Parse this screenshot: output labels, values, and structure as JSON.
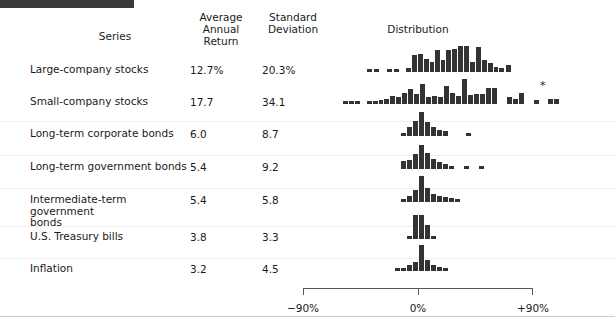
{
  "figure": {
    "distribution_title": "Distribution"
  },
  "table": {
    "headers": {
      "series": "Series",
      "average_annual_return": "Average\nAnnual\nReturn",
      "standard_deviation": "Standard\nDeviation",
      "distribution": "Distribution"
    },
    "rows": [
      {
        "series": "Large-company stocks",
        "average_annual_return": "12.7%",
        "standard_deviation": "20.3%",
        "top": 64,
        "footnote": ""
      },
      {
        "series": "Small-company stocks",
        "average_annual_return": "17.7",
        "standard_deviation": "34.1",
        "top": 96,
        "footnote": "*"
      },
      {
        "series": "Long-term corporate bonds",
        "average_annual_return": "6.0",
        "standard_deviation": "8.7",
        "top": 128,
        "footnote": ""
      },
      {
        "series": "Long-term government bonds",
        "average_annual_return": "5.4",
        "standard_deviation": "9.2",
        "top": 161,
        "footnote": ""
      },
      {
        "series": "Intermediate-term government\nbonds",
        "average_annual_return": "5.4",
        "standard_deviation": "5.8",
        "top": 194,
        "footnote": ""
      },
      {
        "series": "U.S. Treasury bills",
        "average_annual_return": "3.8",
        "standard_deviation": "3.3",
        "top": 231,
        "footnote": ""
      },
      {
        "series": "Inflation",
        "average_annual_return": "3.2",
        "standard_deviation": "4.5",
        "top": 263,
        "footnote": ""
      }
    ]
  },
  "axis": {
    "min_label": "−90%",
    "zero_label": "0%",
    "max_label": "+90%",
    "min_value": -90,
    "zero_value": 0,
    "max_value": 90
  },
  "style": {
    "bar_color": "#333335",
    "rule_color": "#3a3a3c",
    "axis_color": "#58585a",
    "text_color": "#1a1a1a"
  },
  "chart_data": {
    "type": "bar",
    "title": "Distribution",
    "xlabel": "Annual return (%)",
    "ylabel": "Frequency (years)",
    "xlim": [
      -90,
      90
    ],
    "grid": false,
    "legend": "none",
    "note": "Seven stacked histograms of annual returns; bin width 10 percentage points; bar height = number of years in bin.",
    "bin_edges": [
      -90,
      -80,
      -70,
      -60,
      -50,
      -40,
      -30,
      -20,
      -10,
      0,
      10,
      20,
      30,
      40,
      50,
      60,
      70,
      80,
      90
    ],
    "series": [
      {
        "name": "Large-company stocks",
        "average_annual_return": 12.7,
        "standard_deviation": 20.3,
        "bins": [
          -55,
          -45,
          -35,
          -30,
          -25,
          -20,
          -15,
          -10,
          -5,
          0,
          5,
          10,
          15,
          20,
          25,
          30,
          35,
          40,
          45,
          50,
          55,
          60
        ],
        "counts": [
          1,
          1,
          0,
          1,
          1,
          0,
          2,
          3,
          5,
          3,
          6,
          4,
          7,
          8,
          9,
          9,
          4,
          8,
          4,
          3,
          1,
          2
        ]
      },
      {
        "name": "Small-company stocks",
        "average_annual_return": 17.7,
        "standard_deviation": 34.1,
        "footnote": "*",
        "bins": [
          -60,
          -55,
          -50,
          -45,
          -40,
          -35,
          -30,
          -25,
          -20,
          -15,
          -10,
          -5,
          0,
          5,
          10,
          15,
          20,
          25,
          30,
          35,
          40,
          45,
          50,
          55,
          60,
          65,
          70,
          75,
          80,
          85,
          90,
          95,
          100,
          110,
          120,
          130,
          140
        ],
        "counts": [
          1,
          1,
          1,
          0,
          1,
          1,
          1,
          1,
          2,
          2,
          3,
          4,
          5,
          3,
          7,
          4,
          3,
          8,
          5,
          4,
          3,
          2,
          9,
          3,
          3,
          5,
          5,
          1,
          0,
          2,
          3,
          1,
          0,
          1,
          0,
          2,
          2
        ]
      },
      {
        "name": "Long-term corporate bonds",
        "average_annual_return": 6.0,
        "standard_deviation": 8.7,
        "bins": [
          -10,
          -5,
          0,
          5,
          10,
          15,
          20,
          25,
          30,
          45
        ],
        "counts": [
          1,
          4,
          7,
          12,
          7,
          4,
          3,
          2,
          1,
          1
        ]
      },
      {
        "name": "Long-term government bonds",
        "average_annual_return": 5.4,
        "standard_deviation": 9.2,
        "bins": [
          -10,
          -5,
          0,
          5,
          10,
          15,
          20,
          25,
          30,
          40,
          50
        ],
        "counts": [
          3,
          4,
          6,
          11,
          7,
          5,
          3,
          2,
          1,
          1,
          1
        ]
      },
      {
        "name": "Intermediate-term government bonds",
        "average_annual_return": 5.4,
        "standard_deviation": 5.8,
        "bins": [
          -10,
          -5,
          0,
          5,
          10,
          15,
          20,
          25,
          30
        ],
        "counts": [
          1,
          2,
          5,
          13,
          6,
          4,
          3,
          2,
          1
        ]
      },
      {
        "name": "U.S. Treasury bills",
        "average_annual_return": 3.8,
        "standard_deviation": 3.3,
        "bins": [
          -5,
          0,
          5,
          10,
          15
        ],
        "counts": [
          1,
          15,
          9,
          2,
          1
        ]
      },
      {
        "name": "Inflation",
        "average_annual_return": 3.2,
        "standard_deviation": 4.5,
        "bins": [
          -15,
          -10,
          -5,
          0,
          5,
          10,
          15,
          20
        ],
        "counts": [
          1,
          2,
          4,
          16,
          6,
          4,
          2,
          1
        ]
      }
    ]
  },
  "bar_layout": [
    {
      "row": 0,
      "bars": [
        {
          "x": 64,
          "w": 5,
          "h": 3
        },
        {
          "x": 71,
          "w": 5,
          "h": 3
        },
        {
          "x": 84,
          "w": 5,
          "h": 3
        },
        {
          "x": 91,
          "w": 5,
          "h": 3
        },
        {
          "x": 103,
          "w": 5,
          "h": 4
        },
        {
          "x": 109,
          "w": 5,
          "h": 17
        },
        {
          "x": 115,
          "w": 5,
          "h": 18
        },
        {
          "x": 121,
          "w": 5,
          "h": 13
        },
        {
          "x": 127,
          "w": 4,
          "h": 10
        },
        {
          "x": 132,
          "w": 5,
          "h": 22
        },
        {
          "x": 138,
          "w": 4,
          "h": 12
        },
        {
          "x": 143,
          "w": 5,
          "h": 22
        },
        {
          "x": 149,
          "w": 5,
          "h": 23
        },
        {
          "x": 155,
          "w": 5,
          "h": 26
        },
        {
          "x": 161,
          "w": 5,
          "h": 26
        },
        {
          "x": 167,
          "w": 5,
          "h": 10
        },
        {
          "x": 173,
          "w": 5,
          "h": 25
        },
        {
          "x": 179,
          "w": 5,
          "h": 12
        },
        {
          "x": 185,
          "w": 5,
          "h": 9
        },
        {
          "x": 191,
          "w": 4,
          "h": 5
        },
        {
          "x": 196,
          "w": 5,
          "h": 4
        },
        {
          "x": 203,
          "w": 5,
          "h": 7
        }
      ]
    },
    {
      "row": 1,
      "bars": [
        {
          "x": 40,
          "w": 5,
          "h": 3
        },
        {
          "x": 46,
          "w": 5,
          "h": 3
        },
        {
          "x": 52,
          "w": 5,
          "h": 3
        },
        {
          "x": 64,
          "w": 5,
          "h": 3
        },
        {
          "x": 70,
          "w": 5,
          "h": 3
        },
        {
          "x": 76,
          "w": 4,
          "h": 4
        },
        {
          "x": 81,
          "w": 5,
          "h": 5
        },
        {
          "x": 87,
          "w": 5,
          "h": 8
        },
        {
          "x": 93,
          "w": 5,
          "h": 7
        },
        {
          "x": 99,
          "w": 5,
          "h": 11
        },
        {
          "x": 105,
          "w": 5,
          "h": 15
        },
        {
          "x": 111,
          "w": 5,
          "h": 10
        },
        {
          "x": 117,
          "w": 5,
          "h": 20
        },
        {
          "x": 123,
          "w": 5,
          "h": 7
        },
        {
          "x": 129,
          "w": 5,
          "h": 8
        },
        {
          "x": 135,
          "w": 5,
          "h": 7
        },
        {
          "x": 141,
          "w": 5,
          "h": 18
        },
        {
          "x": 147,
          "w": 5,
          "h": 11
        },
        {
          "x": 153,
          "w": 5,
          "h": 8
        },
        {
          "x": 159,
          "w": 5,
          "h": 25
        },
        {
          "x": 165,
          "w": 5,
          "h": 9
        },
        {
          "x": 171,
          "w": 5,
          "h": 10
        },
        {
          "x": 177,
          "w": 5,
          "h": 10
        },
        {
          "x": 183,
          "w": 5,
          "h": 16
        },
        {
          "x": 189,
          "w": 5,
          "h": 16
        },
        {
          "x": 204,
          "w": 5,
          "h": 7
        },
        {
          "x": 210,
          "w": 5,
          "h": 5
        },
        {
          "x": 216,
          "w": 5,
          "h": 11
        },
        {
          "x": 231,
          "w": 5,
          "h": 4
        },
        {
          "x": 245,
          "w": 5,
          "h": 5
        },
        {
          "x": 251,
          "w": 5,
          "h": 5
        }
      ]
    },
    {
      "row": 2,
      "bars": [
        {
          "x": 98,
          "w": 5,
          "h": 3
        },
        {
          "x": 104,
          "w": 5,
          "h": 9
        },
        {
          "x": 110,
          "w": 5,
          "h": 15
        },
        {
          "x": 116,
          "w": 5,
          "h": 24
        },
        {
          "x": 122,
          "w": 5,
          "h": 14
        },
        {
          "x": 128,
          "w": 5,
          "h": 9
        },
        {
          "x": 134,
          "w": 5,
          "h": 6
        },
        {
          "x": 140,
          "w": 5,
          "h": 5
        },
        {
          "x": 163,
          "w": 5,
          "h": 3
        }
      ]
    },
    {
      "row": 3,
      "bars": [
        {
          "x": 98,
          "w": 5,
          "h": 8
        },
        {
          "x": 104,
          "w": 5,
          "h": 9
        },
        {
          "x": 110,
          "w": 5,
          "h": 15
        },
        {
          "x": 116,
          "w": 5,
          "h": 24
        },
        {
          "x": 122,
          "w": 5,
          "h": 16
        },
        {
          "x": 128,
          "w": 5,
          "h": 10
        },
        {
          "x": 134,
          "w": 5,
          "h": 7
        },
        {
          "x": 140,
          "w": 5,
          "h": 5
        },
        {
          "x": 146,
          "w": 5,
          "h": 3
        },
        {
          "x": 161,
          "w": 5,
          "h": 3
        },
        {
          "x": 176,
          "w": 5,
          "h": 3
        }
      ]
    },
    {
      "row": 4,
      "bars": [
        {
          "x": 98,
          "w": 5,
          "h": 3
        },
        {
          "x": 104,
          "w": 5,
          "h": 6
        },
        {
          "x": 110,
          "w": 5,
          "h": 12
        },
        {
          "x": 116,
          "w": 5,
          "h": 26
        },
        {
          "x": 122,
          "w": 5,
          "h": 14
        },
        {
          "x": 128,
          "w": 5,
          "h": 8
        },
        {
          "x": 134,
          "w": 5,
          "h": 6
        },
        {
          "x": 140,
          "w": 5,
          "h": 5
        },
        {
          "x": 146,
          "w": 5,
          "h": 4
        },
        {
          "x": 152,
          "w": 5,
          "h": 3
        }
      ]
    },
    {
      "row": 5,
      "bars": [
        {
          "x": 104,
          "w": 5,
          "h": 3
        },
        {
          "x": 110,
          "w": 5,
          "h": 24
        },
        {
          "x": 116,
          "w": 5,
          "h": 24
        },
        {
          "x": 122,
          "w": 5,
          "h": 14
        },
        {
          "x": 128,
          "w": 5,
          "h": 3
        }
      ]
    },
    {
      "row": 6,
      "bars": [
        {
          "x": 92,
          "w": 5,
          "h": 3
        },
        {
          "x": 98,
          "w": 5,
          "h": 3
        },
        {
          "x": 104,
          "w": 5,
          "h": 6
        },
        {
          "x": 110,
          "w": 5,
          "h": 9
        },
        {
          "x": 116,
          "w": 5,
          "h": 26
        },
        {
          "x": 122,
          "w": 5,
          "h": 11
        },
        {
          "x": 128,
          "w": 5,
          "h": 6
        },
        {
          "x": 134,
          "w": 5,
          "h": 4
        },
        {
          "x": 140,
          "w": 5,
          "h": 3
        }
      ]
    }
  ]
}
